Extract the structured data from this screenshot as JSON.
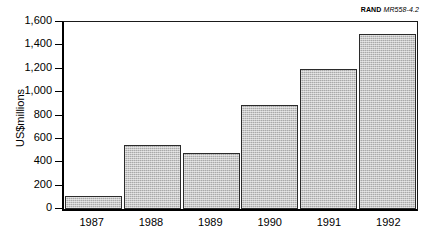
{
  "credit": {
    "org": "RAND",
    "code": "MR558-4.2"
  },
  "chart_data": {
    "type": "bar",
    "title": "",
    "xlabel": "",
    "ylabel": "US$millions",
    "categories": [
      "1987",
      "1988",
      "1989",
      "1990",
      "1991",
      "1992"
    ],
    "values": [
      110,
      550,
      480,
      890,
      1200,
      1500
    ],
    "ylim": [
      0,
      1600
    ],
    "ytick_values": [
      0,
      200,
      400,
      600,
      800,
      1000,
      1200,
      1400,
      1600
    ],
    "ytick_labels": [
      "0",
      "200",
      "400",
      "600",
      "800",
      "1,000",
      "1,200",
      "1,400",
      "1,600"
    ],
    "grid": false,
    "legend": null,
    "series": [
      {
        "name": "US$millions",
        "values": [
          110,
          550,
          480,
          890,
          1200,
          1500
        ]
      }
    ],
    "bar_fill_color": "#a9a9a9",
    "bar_border_color": "#2b2b2b",
    "axis_color": "#000000"
  }
}
